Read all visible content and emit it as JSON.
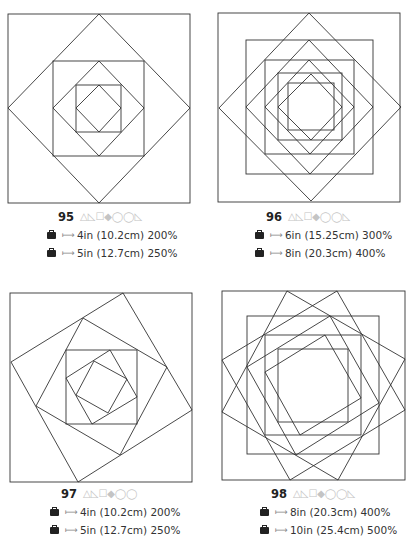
{
  "stroke_color": "#333333",
  "patterns": [
    {
      "number": "95",
      "icons": "△◺☐◆◯◯◺",
      "sizes": [
        {
          "text": "4in (10.2cm) 200%"
        },
        {
          "text": "5in (12.7cm) 250%"
        }
      ]
    },
    {
      "number": "96",
      "icons": "△◺☐◆◯◯◺",
      "sizes": [
        {
          "text": "6in (15.25cm) 300%"
        },
        {
          "text": "8in (20.3cm) 400%"
        }
      ]
    },
    {
      "number": "97",
      "icons": "△◺☐◆◯◯",
      "sizes": [
        {
          "text": "4in (10.2cm) 200%"
        },
        {
          "text": "5in (12.7cm) 250%"
        }
      ]
    },
    {
      "number": "98",
      "icons": "△◺☐◆◯◯◺",
      "sizes": [
        {
          "text": "8in (20.3cm) 400%"
        },
        {
          "text": "10in (25.4cm) 500%"
        }
      ]
    }
  ],
  "arrow_glyph": "⟼"
}
